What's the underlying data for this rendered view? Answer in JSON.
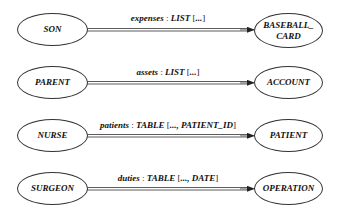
{
  "diagram": {
    "rows": [
      {
        "source": "SON",
        "target": "BASEBALL_\nCARD",
        "edge": {
          "attribute": "expenses",
          "type": "LIST",
          "open": "[",
          "args": "...",
          "close": "]"
        }
      },
      {
        "source": "PARENT",
        "target": "ACCOUNT",
        "edge": {
          "attribute": "assets",
          "type": "LIST",
          "open": "[",
          "args": "...",
          "close": "]"
        }
      },
      {
        "source": "NURSE",
        "target": "PATIENT",
        "edge": {
          "attribute": "patients",
          "type": "TABLE",
          "open": "[",
          "args": "..., PATIENT_ID",
          "close": "]"
        }
      },
      {
        "source": "SURGEON",
        "target": "OPERATION",
        "edge": {
          "attribute": "duties",
          "type": "TABLE",
          "open": "[",
          "args": "..., DATE",
          "close": "]"
        }
      }
    ],
    "colors": {
      "stroke": "#333333",
      "text": "#111111",
      "background": "#ffffff"
    }
  }
}
